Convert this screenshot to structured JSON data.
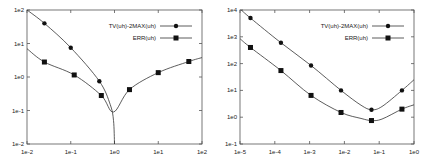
{
  "chart_data": [
    {
      "type": "line",
      "title": "",
      "xlabel": "",
      "ylabel": "",
      "xscale": "log",
      "yscale": "log",
      "xlim": [
        0.01,
        100
      ],
      "ylim": [
        0.01,
        100
      ],
      "x_ticks": [
        "1e-2",
        "1e-1",
        "1e0",
        "1e1",
        "1e2"
      ],
      "y_ticks": [
        "1e-2",
        "1e-1",
        "1e0",
        "1e1",
        "1e2"
      ],
      "grid": false,
      "legend_position": "upper right",
      "series": [
        {
          "name": "TV(uh)-2MAX(uh)",
          "marker": "circle",
          "points": [
            [
              0.025,
              40
            ],
            [
              0.1,
              7.5
            ],
            [
              0.45,
              0.75
            ]
          ],
          "curve": [
            [
              0.01,
              100
            ],
            [
              0.025,
              40
            ],
            [
              0.1,
              7.5
            ],
            [
              0.45,
              0.75
            ],
            [
              0.8,
              0.15
            ],
            [
              0.95,
              0.05
            ],
            [
              1.0,
              0.01
            ]
          ]
        },
        {
          "name": "ERR(uh)",
          "marker": "square",
          "points": [
            [
              0.025,
              2.8
            ],
            [
              0.12,
              1.15
            ],
            [
              0.5,
              0.28
            ],
            [
              2.2,
              0.42
            ],
            [
              10,
              1.35
            ],
            [
              50,
              2.9
            ]
          ],
          "curve": [
            [
              0.01,
              7
            ],
            [
              0.025,
              2.8
            ],
            [
              0.12,
              1.15
            ],
            [
              0.5,
              0.28
            ],
            [
              0.95,
              0.09
            ],
            [
              2.2,
              0.42
            ],
            [
              10,
              1.35
            ],
            [
              50,
              2.9
            ],
            [
              100,
              3.8
            ]
          ]
        }
      ],
      "legend": [
        {
          "label": "TV(uh)-2MAX(uh)",
          "marker": "circle"
        },
        {
          "label": "ERR(uh)",
          "marker": "square"
        }
      ]
    },
    {
      "type": "line",
      "title": "",
      "xlabel": "",
      "ylabel": "",
      "xscale": "log",
      "yscale": "log",
      "xlim": [
        1e-05,
        1
      ],
      "ylim": [
        0.1,
        10000
      ],
      "x_ticks": [
        "1e-5",
        "1e-4",
        "1e-3",
        "1e-2",
        "1e-1",
        "1e0"
      ],
      "y_ticks": [
        "1e-1",
        "1e0",
        "1e1",
        "1e2",
        "1e3",
        "1e4"
      ],
      "grid": false,
      "legend_position": "upper right",
      "series": [
        {
          "name": "TV(uh)-2MAX(uh)",
          "marker": "circle",
          "points": [
            [
              2e-05,
              5000
            ],
            [
              0.00015,
              600
            ],
            [
              0.0011,
              85
            ],
            [
              0.008,
              10
            ],
            [
              0.06,
              1.9
            ],
            [
              0.45,
              10
            ]
          ],
          "curve": [
            [
              1e-05,
              11000
            ],
            [
              2e-05,
              5000
            ],
            [
              0.00015,
              600
            ],
            [
              0.0011,
              85
            ],
            [
              0.008,
              10
            ],
            [
              0.03,
              2.8
            ],
            [
              0.06,
              1.9
            ],
            [
              0.12,
              2.5
            ],
            [
              0.45,
              10
            ],
            [
              1,
              25
            ]
          ]
        },
        {
          "name": "ERR(uh)",
          "marker": "square",
          "points": [
            [
              2e-05,
              400
            ],
            [
              0.00015,
              55
            ],
            [
              0.0011,
              6.5
            ],
            [
              0.008,
              1.5
            ],
            [
              0.06,
              0.75
            ],
            [
              0.45,
              2
            ]
          ],
          "curve": [
            [
              1e-05,
              850
            ],
            [
              2e-05,
              400
            ],
            [
              0.00015,
              55
            ],
            [
              0.0011,
              6.5
            ],
            [
              0.008,
              1.5
            ],
            [
              0.03,
              0.9
            ],
            [
              0.06,
              0.75
            ],
            [
              0.12,
              0.85
            ],
            [
              0.45,
              2
            ],
            [
              1,
              2.9
            ]
          ]
        }
      ],
      "legend": [
        {
          "label": "TV(uh)-2MAX(uh)",
          "marker": "circle"
        },
        {
          "label": "ERR(uh)",
          "marker": "square"
        }
      ]
    }
  ]
}
